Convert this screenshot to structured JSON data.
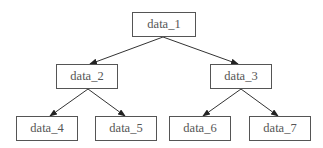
{
  "diagram": {
    "type": "tree",
    "nodes": [
      {
        "id": "data_1",
        "label": "data_1",
        "x": 132,
        "y": 12,
        "w": 64,
        "h": 25
      },
      {
        "id": "data_2",
        "label": "data_2",
        "x": 56,
        "y": 64,
        "w": 62,
        "h": 25
      },
      {
        "id": "data_3",
        "label": "data_3",
        "x": 210,
        "y": 64,
        "w": 62,
        "h": 25
      },
      {
        "id": "data_4",
        "label": "data_4",
        "x": 16,
        "y": 116,
        "w": 62,
        "h": 25
      },
      {
        "id": "data_5",
        "label": "data_5",
        "x": 95,
        "y": 116,
        "w": 62,
        "h": 25
      },
      {
        "id": "data_6",
        "label": "data_6",
        "x": 169,
        "y": 116,
        "w": 62,
        "h": 25
      },
      {
        "id": "data_7",
        "label": "data_7",
        "x": 249,
        "y": 116,
        "w": 62,
        "h": 25
      }
    ],
    "edges": [
      {
        "from": "data_1",
        "to": "data_2"
      },
      {
        "from": "data_1",
        "to": "data_3"
      },
      {
        "from": "data_2",
        "to": "data_4"
      },
      {
        "from": "data_2",
        "to": "data_5"
      },
      {
        "from": "data_3",
        "to": "data_6"
      },
      {
        "from": "data_3",
        "to": "data_7"
      }
    ]
  }
}
